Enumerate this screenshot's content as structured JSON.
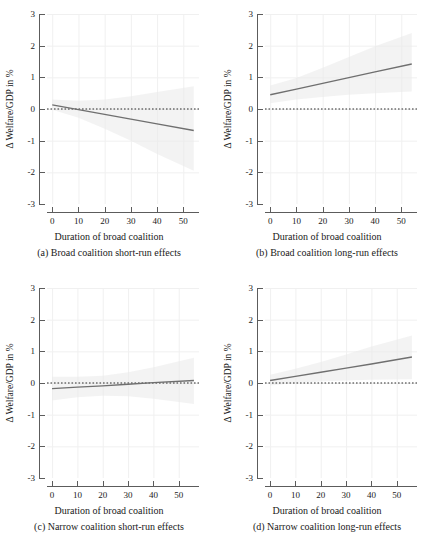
{
  "figure": {
    "axis_title": "Duration of broad coalition",
    "y_axis_title": "Δ Welfare/GDP in %",
    "y_ticks": [
      "3",
      "2",
      "1",
      "0",
      "-1",
      "-2",
      "-3"
    ],
    "x_ticks": [
      "0",
      "10",
      "20",
      "30",
      "40",
      "50"
    ],
    "colors": {
      "line": "#6f6f6f",
      "zero_line": "#2b2b2b",
      "grid": "#f0f0f0",
      "axis": "#5c5c5c",
      "band": "#e9e9e9",
      "background": "#ffffff"
    }
  },
  "chart_data": [
    {
      "type": "line",
      "panel": "a",
      "title": "(a) Broad coalition short-run effects",
      "xlabel": "Duration of broad coalition",
      "ylabel": "Δ Welfare/GDP in %",
      "xlim": [
        -2,
        56
      ],
      "ylim": [
        -3,
        3
      ],
      "xticks": [
        0,
        10,
        20,
        30,
        40,
        50
      ],
      "yticks": [
        -3,
        -2,
        -1,
        0,
        1,
        2,
        3
      ],
      "grid": true,
      "zero_reference_line": 0,
      "x": [
        0,
        10,
        20,
        30,
        40,
        54
      ],
      "values": [
        0.13,
        -0.02,
        -0.17,
        -0.32,
        -0.47,
        -0.68
      ],
      "ci_lower": [
        -0.02,
        -0.28,
        -0.62,
        -1.0,
        -1.42,
        -1.95
      ],
      "ci_upper": [
        0.3,
        0.26,
        0.3,
        0.4,
        0.54,
        0.72
      ],
      "series": [
        {
          "name": "Marginal effect",
          "values": [
            0.13,
            -0.02,
            -0.17,
            -0.32,
            -0.47,
            -0.68
          ]
        }
      ]
    },
    {
      "type": "line",
      "panel": "b",
      "title": "(b) Broad coalition long-run effects",
      "xlabel": "Duration of broad coalition",
      "ylabel": "Δ Welfare/GDP in %",
      "xlim": [
        -2,
        56
      ],
      "ylim": [
        -3,
        3
      ],
      "xticks": [
        0,
        10,
        20,
        30,
        40,
        50
      ],
      "yticks": [
        -3,
        -2,
        -1,
        0,
        1,
        2,
        3
      ],
      "grid": true,
      "zero_reference_line": 0,
      "x": [
        0,
        10,
        20,
        30,
        40,
        54
      ],
      "values": [
        0.45,
        0.63,
        0.81,
        0.99,
        1.17,
        1.42
      ],
      "ci_lower": [
        0.18,
        0.3,
        0.38,
        0.45,
        0.5,
        0.55
      ],
      "ci_upper": [
        0.74,
        0.98,
        1.3,
        1.64,
        1.98,
        2.4
      ],
      "series": [
        {
          "name": "Marginal effect",
          "values": [
            0.45,
            0.63,
            0.81,
            0.99,
            1.17,
            1.42
          ]
        }
      ]
    },
    {
      "type": "line",
      "panel": "c",
      "title": "(c) Narrow coalition short-run effects",
      "xlabel": "Duration of broad coalition",
      "ylabel": "Δ Welfare/GDP in %",
      "xlim": [
        -2,
        58
      ],
      "ylim": [
        -3,
        3
      ],
      "xticks": [
        0,
        10,
        20,
        30,
        40,
        50
      ],
      "yticks": [
        -3,
        -2,
        -1,
        0,
        1,
        2,
        3
      ],
      "grid": true,
      "zero_reference_line": 0,
      "x": [
        0,
        10,
        20,
        30,
        40,
        56
      ],
      "values": [
        -0.18,
        -0.13,
        -0.09,
        -0.04,
        0.01,
        0.08
      ],
      "ci_lower": [
        -0.55,
        -0.45,
        -0.4,
        -0.42,
        -0.5,
        -0.66
      ],
      "ci_upper": [
        0.2,
        0.2,
        0.23,
        0.34,
        0.5,
        0.8
      ],
      "series": [
        {
          "name": "Marginal effect",
          "values": [
            -0.18,
            -0.13,
            -0.09,
            -0.04,
            0.01,
            0.08
          ]
        }
      ]
    },
    {
      "type": "line",
      "panel": "d",
      "title": "(d) Narrow coalition long-run effects",
      "xlabel": "Duration of broad coalition",
      "ylabel": "Δ Welfare/GDP in %",
      "xlim": [
        -2,
        58
      ],
      "ylim": [
        -3,
        3
      ],
      "xticks": [
        0,
        10,
        20,
        30,
        40,
        50
      ],
      "yticks": [
        -3,
        -2,
        -1,
        0,
        1,
        2,
        3
      ],
      "grid": true,
      "zero_reference_line": 0,
      "x": [
        0,
        10,
        20,
        30,
        40,
        56
      ],
      "values": [
        0.08,
        0.21,
        0.34,
        0.47,
        0.6,
        0.82
      ],
      "ci_lower": [
        -0.08,
        0.0,
        0.05,
        0.08,
        0.1,
        0.12
      ],
      "ci_upper": [
        0.26,
        0.45,
        0.66,
        0.9,
        1.15,
        1.5
      ],
      "series": [
        {
          "name": "Marginal effect",
          "values": [
            0.08,
            0.21,
            0.34,
            0.47,
            0.6,
            0.82
          ]
        }
      ]
    }
  ]
}
